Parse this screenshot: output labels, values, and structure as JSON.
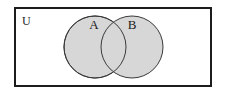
{
  "diagram": {
    "type": "venn",
    "kind": "two-set-overlapping-venn-diagram",
    "universe": {
      "label": "U",
      "label_x": 22,
      "label_y": 25,
      "rect": {
        "x": 15,
        "y": 8,
        "width": 196,
        "height": 78
      },
      "fill_color": "#ffffff",
      "border_color": "#1c1c1c",
      "border_width": 2
    },
    "sets": [
      {
        "name": "set-a",
        "label": "A",
        "label_x": 94,
        "label_y": 29,
        "cx": 95,
        "cy": 47,
        "r": 31,
        "fill_color": "#d7d7d7",
        "stroke_color": "#3a3a3a",
        "stroke_width": 1
      },
      {
        "name": "set-b",
        "label": "B",
        "label_x": 132,
        "label_y": 29,
        "cx": 132,
        "cy": 47,
        "r": 31,
        "fill_color": "#d7d7d7",
        "stroke_color": "#3a3a3a",
        "stroke_width": 1
      }
    ],
    "intersection": {
      "name": "a-intersect-b",
      "fill_color": "#d7d7d7",
      "labelled": false
    }
  }
}
